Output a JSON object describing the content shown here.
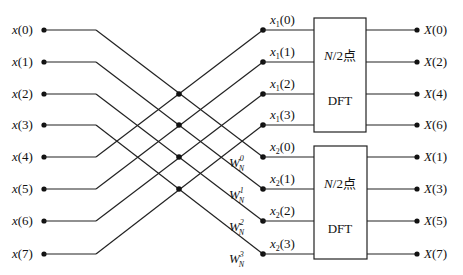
{
  "diagram": {
    "type": "butterfly-flow-graph",
    "inputs": [
      {
        "var": "x",
        "idx": "(0)"
      },
      {
        "var": "x",
        "idx": "(1)"
      },
      {
        "var": "x",
        "idx": "(2)"
      },
      {
        "var": "x",
        "idx": "(3)"
      },
      {
        "var": "x",
        "idx": "(4)"
      },
      {
        "var": "x",
        "idx": "(5)"
      },
      {
        "var": "x",
        "idx": "(6)"
      },
      {
        "var": "x",
        "idx": "(7)"
      }
    ],
    "intermediate": [
      {
        "var": "x",
        "sub": "1",
        "idx": "(0)"
      },
      {
        "var": "x",
        "sub": "1",
        "idx": "(1)"
      },
      {
        "var": "x",
        "sub": "1",
        "idx": "(2)"
      },
      {
        "var": "x",
        "sub": "1",
        "idx": "(3)"
      },
      {
        "var": "x",
        "sub": "2",
        "idx": "(0)"
      },
      {
        "var": "x",
        "sub": "2",
        "idx": "(1)"
      },
      {
        "var": "x",
        "sub": "2",
        "idx": "(2)"
      },
      {
        "var": "x",
        "sub": "2",
        "idx": "(3)"
      }
    ],
    "twiddles": [
      {
        "base": "W",
        "sup": "0",
        "sub": "N"
      },
      {
        "base": "W",
        "sup": "1",
        "sub": "N"
      },
      {
        "base": "W",
        "sup": "2",
        "sub": "N"
      },
      {
        "base": "W",
        "sup": "3",
        "sub": "N"
      }
    ],
    "blocks": [
      {
        "line1": "N/2点",
        "line1_var": "N",
        "line1_rest": "/2点",
        "line2": "DFT"
      },
      {
        "line1": "N/2点",
        "line1_var": "N",
        "line1_rest": "/2点",
        "line2": "DFT"
      }
    ],
    "outputs": [
      {
        "var": "X",
        "idx": "(0)"
      },
      {
        "var": "X",
        "idx": "(2)"
      },
      {
        "var": "X",
        "idx": "(4)"
      },
      {
        "var": "X",
        "idx": "(6)"
      },
      {
        "var": "X",
        "idx": "(1)"
      },
      {
        "var": "X",
        "idx": "(3)"
      },
      {
        "var": "X",
        "idx": "(5)"
      },
      {
        "var": "X",
        "idx": "(7)"
      }
    ]
  }
}
